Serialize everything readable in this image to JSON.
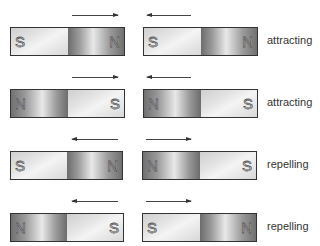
{
  "rows": [
    {
      "label": "attracting",
      "arrows": [
        {
          "direction": "right"
        },
        {
          "direction": "left"
        }
      ],
      "magnets": [
        {
          "left_pole": "S",
          "right_pole": "N"
        },
        {
          "left_pole": "S",
          "right_pole": "N"
        }
      ]
    },
    {
      "label": "attracting",
      "arrows": [
        {
          "direction": "right"
        },
        {
          "direction": "left"
        }
      ],
      "magnets": [
        {
          "left_pole": "N",
          "right_pole": "S"
        },
        {
          "left_pole": "N",
          "right_pole": "S"
        }
      ]
    },
    {
      "label": "repelling",
      "arrows": [
        {
          "direction": "left"
        },
        {
          "direction": "right"
        }
      ],
      "magnets": [
        {
          "left_pole": "S",
          "right_pole": "N"
        },
        {
          "left_pole": "N",
          "right_pole": "S"
        }
      ]
    },
    {
      "label": "repelling",
      "arrows": [
        {
          "direction": "left"
        },
        {
          "direction": "right"
        }
      ],
      "magnets": [
        {
          "left_pole": "N",
          "right_pole": "S"
        },
        {
          "left_pole": "S",
          "right_pole": "N"
        }
      ]
    }
  ]
}
